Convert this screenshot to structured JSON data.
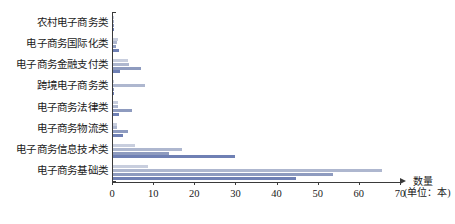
{
  "chart_data": {
    "type": "bar",
    "orientation": "horizontal",
    "title": "",
    "xlabel": "数量",
    "xlabel_unit": "(单位：本)",
    "ylabel": "",
    "xlim": [
      0,
      70
    ],
    "xticks": [
      0,
      10,
      20,
      30,
      40,
      50,
      60,
      70
    ],
    "xticklabels": [
      "0",
      "10",
      "20",
      "30",
      "40",
      "50",
      "60",
      "70"
    ],
    "grid": false,
    "legend": "none",
    "categories": [
      "农村电子商务类",
      "电子商务国际化类",
      "电子商务金融支付类",
      "跨境电子商务类",
      "电子商务法律类",
      "电子商务物流类",
      "电子商务信息技术类",
      "电子商务基础类"
    ],
    "series": [
      {
        "name": "系列1",
        "color": "#c8cede",
        "values": [
          0.3,
          1.2,
          3.6,
          0.2,
          1.1,
          1.0,
          5.4,
          8.6
        ]
      },
      {
        "name": "系列2",
        "color": "#aeb7cf",
        "values": [
          0.2,
          0.9,
          3.8,
          7.7,
          1.2,
          0.9,
          16.7,
          65.5
        ]
      },
      {
        "name": "系列3",
        "color": "#8e9bbf",
        "values": [
          0.2,
          0.8,
          6.9,
          0.2,
          4.5,
          3.7,
          13.6,
          53.4
        ]
      },
      {
        "name": "系列4",
        "color": "#6f80b4",
        "values": [
          0.2,
          1.5,
          1.6,
          0.2,
          1.4,
          2.5,
          29.7,
          44.6
        ]
      }
    ]
  },
  "annotations": {
    "unit_note": "(单位：本)",
    "quantity_label": "数量"
  }
}
